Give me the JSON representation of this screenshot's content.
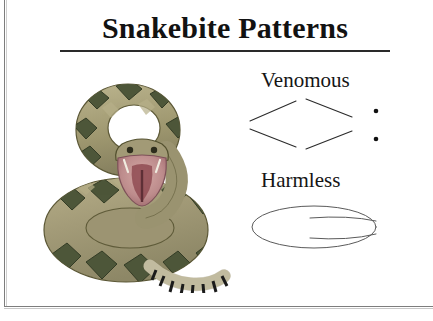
{
  "page": {
    "title": "Snakebite Patterns",
    "background_color": "#ffffff",
    "border_color": "#7d7d7d"
  },
  "categories": [
    {
      "label": "Venomous",
      "pattern_name": "fang-puncture-pattern",
      "marks": 2,
      "mark_color": "#111111"
    },
    {
      "label": "Harmless",
      "pattern_name": "tooth-row-pattern",
      "marks": 0,
      "mark_color": "#111111"
    }
  ],
  "illustration": {
    "name": "coiled-rattlesnake",
    "body_base_color": "#a39b78",
    "body_light_color": "#bcb58f",
    "pattern_color": "#4d5639",
    "pattern_edge_color": "#343c26",
    "mouth_outer_color": "#c39a9a",
    "mouth_inner_color": "#8f4b52",
    "rattle_band_color": "#1b1b1b",
    "rattle_base_color": "#ded8bd",
    "outline_color": "#55522f"
  }
}
